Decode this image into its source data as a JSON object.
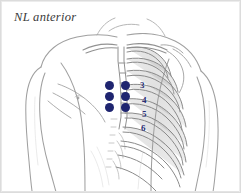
{
  "figure": {
    "title": "NL anterior",
    "view": "anterior",
    "style": "pencil anatomical illustration",
    "frame_color": "#dcdcdc",
    "background_color": "#ffffff",
    "line_color": "#8a8a8a"
  },
  "markers": {
    "color": "#1f2570",
    "count": 6,
    "layout": "2 columns x 3 rows",
    "points": [
      {
        "id": "marker-c1-r1",
        "x": 108,
        "y": 84
      },
      {
        "id": "marker-c2-r1",
        "x": 124,
        "y": 84
      },
      {
        "id": "marker-c1-r2",
        "x": 108,
        "y": 95
      },
      {
        "id": "marker-c2-r2",
        "x": 124,
        "y": 95
      },
      {
        "id": "marker-c1-r3",
        "x": 108,
        "y": 106
      },
      {
        "id": "marker-c2-r3",
        "x": 124,
        "y": 106
      }
    ]
  },
  "rib_labels": {
    "color": "#2a2f75",
    "items": [
      {
        "label": "3",
        "x": 139,
        "y": 85
      },
      {
        "label": "4",
        "x": 141,
        "y": 100
      },
      {
        "label": "5",
        "x": 141,
        "y": 114
      },
      {
        "label": "6",
        "x": 140,
        "y": 128
      }
    ]
  }
}
